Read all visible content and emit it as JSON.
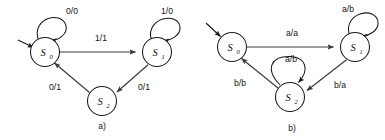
{
  "figure": {
    "background_color": "#ffffff",
    "stroke_color": "#1a1a1a",
    "edge_color": "#3a3a3a",
    "panels": [
      {
        "id": "a",
        "caption": "a)",
        "caption_x": 102,
        "caption_y": 129,
        "alphabet": "binary",
        "states": [
          {
            "id": "s0",
            "label": "S",
            "subscript": "0",
            "cx": 45,
            "cy": 52,
            "r": 14.5,
            "is_start": true
          },
          {
            "id": "s1",
            "label": "S",
            "subscript": "1",
            "cx": 157,
            "cy": 52,
            "r": 14.5,
            "is_start": false
          },
          {
            "id": "s2",
            "label": "S",
            "subscript": "2",
            "cx": 102,
            "cy": 101,
            "r": 14.5,
            "is_start": false
          }
        ],
        "self_loops": [
          {
            "id": "a-loop-s0",
            "state": "s0",
            "label": "0/0",
            "label_x": 72,
            "label_y": 14
          },
          {
            "id": "a-loop-s1",
            "state": "s1",
            "label": "1/0",
            "label_x": 167,
            "label_y": 14
          }
        ],
        "transitions": [
          {
            "id": "a-s0-s1",
            "from": "s0",
            "to": "s1",
            "label": "1/1",
            "label_x": 101,
            "label_y": 41
          },
          {
            "id": "a-s1-s2",
            "from": "s1",
            "to": "s2",
            "label": "0/1",
            "label_x": 144,
            "label_y": 90
          },
          {
            "id": "a-s2-s0",
            "from": "s2",
            "to": "s0",
            "label": "0/1",
            "label_x": 55,
            "label_y": 90
          }
        ]
      },
      {
        "id": "b",
        "caption": "b)",
        "caption_x": 292,
        "caption_y": 131,
        "alphabet": "a/b",
        "states": [
          {
            "id": "s0",
            "label": "S",
            "subscript": "0",
            "cx": 232,
            "cy": 47,
            "r": 14.5,
            "is_start": true
          },
          {
            "id": "s1",
            "label": "S",
            "subscript": "1",
            "cx": 355,
            "cy": 47,
            "r": 14.5,
            "is_start": false
          },
          {
            "id": "s2",
            "label": "S",
            "subscript": "2",
            "cx": 290,
            "cy": 97,
            "r": 14.5,
            "is_start": false
          }
        ],
        "self_loops": [
          {
            "id": "b-loop-s1",
            "state": "s1",
            "label": "a/b",
            "label_x": 348,
            "label_y": 12
          },
          {
            "id": "b-loop-s2",
            "state": "s2",
            "label": "a/b",
            "label_x": 291,
            "label_y": 62
          }
        ],
        "transitions": [
          {
            "id": "b-s0-s1",
            "from": "s0",
            "to": "s1",
            "label": "a/a",
            "label_x": 292,
            "label_y": 36
          },
          {
            "id": "b-s1-s2",
            "from": "s1",
            "to": "s2",
            "label": "b/a",
            "label_x": 340,
            "label_y": 88
          },
          {
            "id": "b-s2-s0",
            "from": "s2",
            "to": "s0",
            "label": "b/b",
            "label_x": 240,
            "label_y": 86
          }
        ]
      }
    ]
  }
}
